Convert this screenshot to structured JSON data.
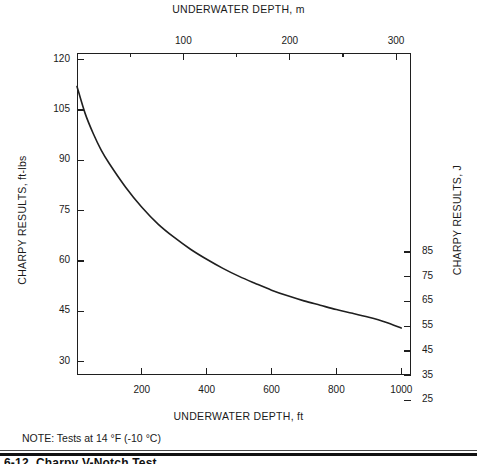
{
  "chart_data": {
    "type": "line",
    "title": "",
    "xlabel": "UNDERWATER DEPTH, ft",
    "ylabel": "CHARPY RESULTS, ft-lbs",
    "xlabel_top": "UNDERWATER DEPTH, m",
    "ylabel_right": "CHARPY RESULTS, J",
    "grid": false,
    "legend": "none",
    "xlim": [
      0,
      1030
    ],
    "ylim": [
      26,
      122
    ],
    "xlim_top_m": [
      0,
      314
    ],
    "ylim_right_J": [
      35.3,
      165.4
    ],
    "x_ticks": [
      200,
      400,
      600,
      800,
      1000
    ],
    "x_tick_labels": [
      "200",
      "400",
      "600",
      "800",
      "1000"
    ],
    "x_ticks_top": [
      50,
      100,
      150,
      200,
      250,
      300
    ],
    "x_tick_labels_top": [
      "",
      "100",
      "",
      "200",
      "",
      "300"
    ],
    "y_ticks": [
      30,
      45,
      60,
      75,
      90,
      105,
      120
    ],
    "y_tick_labels": [
      "30",
      "45",
      "60",
      "75",
      "90",
      "105",
      "120"
    ],
    "y_ticks_right": [
      25,
      35,
      45,
      55,
      65,
      75,
      85
    ],
    "y_tick_labels_right": [
      "25",
      "35",
      "45",
      "55",
      "65",
      "75",
      "85"
    ],
    "x": [
      0,
      25,
      50,
      75,
      100,
      150,
      200,
      250,
      300,
      350,
      400,
      450,
      500,
      550,
      600,
      650,
      700,
      750,
      800,
      850,
      900,
      950,
      1000
    ],
    "values": [
      112,
      104,
      98,
      93,
      89,
      82,
      76,
      71,
      67,
      63.5,
      60.5,
      57.8,
      55.4,
      53.3,
      51.3,
      49.6,
      48.1,
      46.8,
      45.5,
      44.4,
      43.2,
      41.8,
      40
    ],
    "series": [
      {
        "name": "Charpy impact energy vs underwater depth",
        "values": [
          112,
          104,
          98,
          93,
          89,
          82,
          76,
          71,
          67,
          63.5,
          60.5,
          57.8,
          55.4,
          53.3,
          51.3,
          49.6,
          48.1,
          46.8,
          45.5,
          44.4,
          43.2,
          41.8,
          40
        ]
      }
    ],
    "annotations": [
      "NOTE:  Tests at 14 °F (-10 °C)"
    ],
    "line_color": "#1f1f1f"
  },
  "axes": {
    "top_title": "UNDERWATER DEPTH, m",
    "bottom_title": "UNDERWATER DEPTH, ft",
    "left_title": "CHARPY RESULTS, ft-lbs",
    "right_title": "CHARPY RESULTS, J"
  },
  "note": {
    "text": "NOTE:  Tests at 14 °F (-10 °C)"
  },
  "caption": {
    "text": "6-12.   Charpy V-Notch Test"
  },
  "colors": {
    "line": "#1f1f1f",
    "axis": "#1f1f1f",
    "text": "#1a1a1a",
    "background": "#ffffff"
  }
}
